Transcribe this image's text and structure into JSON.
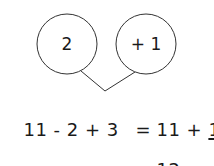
{
  "diagram": {
    "circles": [
      {
        "label": "2"
      },
      {
        "label": "+ 1"
      }
    ],
    "equation_line1": {
      "lhs": "11 - 2 + 3",
      "equals": "=",
      "rhs_prefix": "11 + ",
      "rhs_underlined": "1"
    },
    "equation_line2": {
      "equals": "=",
      "result": "12"
    },
    "colors": {
      "stroke": "#333333",
      "text": "#1a1a1a"
    }
  }
}
